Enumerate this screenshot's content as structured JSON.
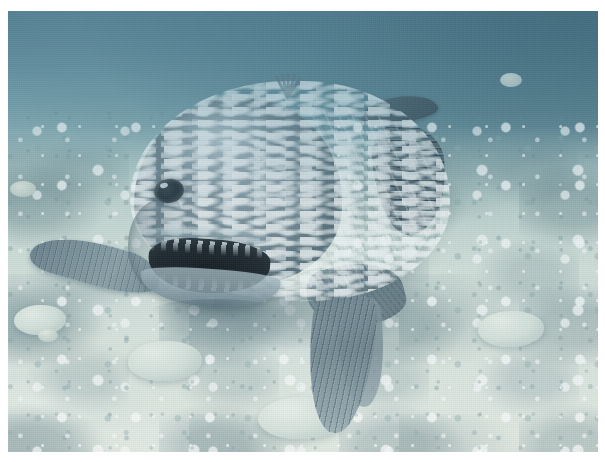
{
  "image": {
    "kind": "underwater-photograph",
    "subject": "coelacanth",
    "subject_description": "Large blue-grey lobe-finned fish facing the camera with open mouth showing teeth",
    "scene": "Seafloor of pale coral rubble in shallow blue-green water",
    "orientation": "landscape",
    "frame": {
      "border_color": "#ffffff",
      "border_width_px": 8,
      "photo_width_px": 590,
      "photo_height_px": 441
    },
    "palette": {
      "water_upper_dark": "#4a707f",
      "water_mid": "#8fb2bd",
      "seafloor_light": "#e6ece4",
      "seafloor_shadow": "#7d9aa3",
      "fish_body": "#768b96",
      "fish_highlight": "#cfe0e6",
      "fish_dark": "#4c6270",
      "mouth_interior": "#18222a",
      "teeth": "#eaf2f4"
    },
    "features": [
      {
        "name": "head",
        "label": "Fish head"
      },
      {
        "name": "eye",
        "label": "Eye"
      },
      {
        "name": "mouth",
        "label": "Open mouth"
      },
      {
        "name": "teeth",
        "label": "Teeth"
      },
      {
        "name": "left-pectoral-fin",
        "label": "Left pectoral fin"
      },
      {
        "name": "right-pectoral-fin",
        "label": "Right pectoral fin"
      },
      {
        "name": "ventral-fin",
        "label": "Ventral lobed fin"
      },
      {
        "name": "first-dorsal-fin",
        "label": "First dorsal fin"
      },
      {
        "name": "second-dorsal-fin",
        "label": "Second dorsal fin"
      },
      {
        "name": "spine-tuft",
        "label": "Dorsal spine tuft"
      },
      {
        "name": "sea-floor",
        "label": "Coral rubble sea floor"
      }
    ]
  }
}
